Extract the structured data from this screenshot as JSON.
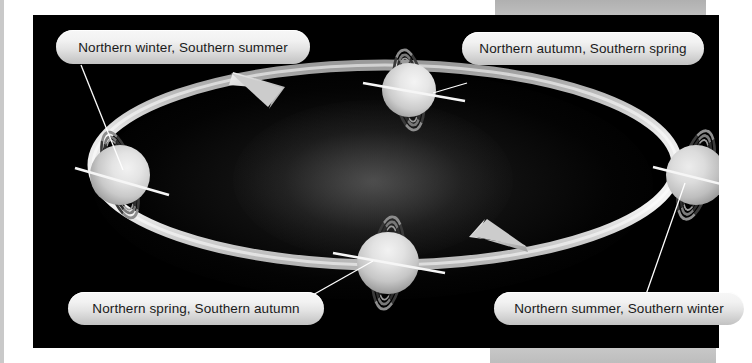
{
  "figure": {
    "background_color": "#000000",
    "page_background_color": "#ffffff",
    "panel_color": "#b6b6b6"
  },
  "sun": {
    "name": "Sun",
    "color": "#ffffff",
    "center": {
      "x": 352,
      "y": 145
    },
    "radius": 34
  },
  "orbit": {
    "direction": "counterclockwise",
    "color": "#e8e8e8",
    "arrow_count": 2,
    "arrows": [
      {
        "name": "orbit-arrow-upper-left",
        "x": 226,
        "y": 68
      },
      {
        "name": "orbit-arrow-lower-right",
        "x": 462,
        "y": 238
      }
    ]
  },
  "planets": [
    {
      "id": "northern-winter",
      "season_label": "Northern winter, Southern summer",
      "position": "left",
      "center": {
        "x": 87,
        "y": 160
      },
      "radius": 30,
      "ring_orientation": "near-vertical",
      "axis_tilt": "pole-on toward viewer"
    },
    {
      "id": "northern-autumn",
      "season_label": "Northern autumn, Southern spring",
      "position": "top",
      "center": {
        "x": 376,
        "y": 75
      },
      "radius": 27,
      "ring_orientation": "near-vertical",
      "axis_tilt": "axis roughly in orbital plane"
    },
    {
      "id": "northern-summer",
      "season_label": "Northern summer, Southern winter",
      "position": "right",
      "center": {
        "x": 663,
        "y": 160
      },
      "radius": 30,
      "ring_orientation": "near-vertical",
      "axis_tilt": "pole-on away from viewer"
    },
    {
      "id": "northern-spring",
      "season_label": "Northern spring, Southern autumn",
      "position": "bottom",
      "center": {
        "x": 355,
        "y": 248
      },
      "radius": 31,
      "ring_orientation": "near-vertical",
      "axis_tilt": "axis roughly in orbital plane"
    }
  ],
  "labels": {
    "northern_winter": "Northern winter, Southern summer",
    "northern_autumn": "Northern autumn, Southern spring",
    "northern_spring": "Northern spring, Southern autumn",
    "northern_summer": "Northern summer, Southern winter"
  }
}
